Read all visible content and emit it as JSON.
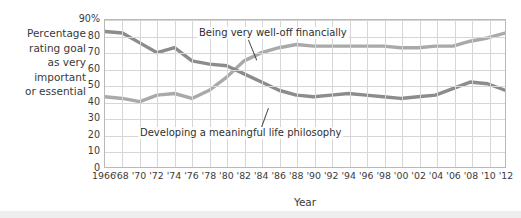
{
  "axis": {
    "y_caption_lines": [
      "Percentage",
      "rating goal",
      "as very",
      "important",
      "or essential"
    ],
    "x_caption": "Year"
  },
  "annotations": {
    "welloff": "Being very well-off financially",
    "philosophy": "Developing a meaningful life philosophy"
  },
  "colors": {
    "series_welloff": "#a9a9a9",
    "series_philosophy": "#8c8c8c",
    "grid": "#d6d6d6",
    "frame": "#b9b9b9",
    "text": "#3a3a3a"
  },
  "chart_data": {
    "type": "line",
    "title": "",
    "subtitle": "",
    "xlabel": "Year",
    "ylabel": "Percentage rating goal as very important or essential",
    "ylim": [
      0,
      90
    ],
    "yticks": [
      0,
      10,
      20,
      30,
      40,
      50,
      60,
      70,
      80,
      90
    ],
    "ytick_labels": [
      "0",
      "10",
      "20",
      "30",
      "40",
      "50",
      "60",
      "70",
      "80",
      "90%"
    ],
    "grid": true,
    "legend": "inline-annotations",
    "x": [
      1966,
      1968,
      1970,
      1972,
      1974,
      1976,
      1978,
      1980,
      1982,
      1984,
      1986,
      1988,
      1990,
      1992,
      1994,
      1996,
      1998,
      2000,
      2002,
      2004,
      2006,
      2008,
      2010,
      2012
    ],
    "xtick_labels": [
      "1966",
      "'68",
      "'70",
      "'72",
      "'74",
      "'76",
      "'78",
      "'80",
      "'82",
      "'84",
      "'86",
      "'88",
      "'90",
      "'92",
      "'94",
      "'96",
      "'98",
      "'00",
      "'02",
      "'04",
      "'06",
      "'08",
      "'10",
      "'12"
    ],
    "series": [
      {
        "name": "Being very well-off financially",
        "color": "#a9a9a9",
        "values": [
          43,
          42,
          40,
          44,
          45,
          42,
          47,
          55,
          65,
          70,
          73,
          75,
          74,
          74,
          74,
          74,
          74,
          73,
          73,
          74,
          74,
          77,
          79,
          82
        ]
      },
      {
        "name": "Developing a meaningful life philosophy",
        "color": "#8c8c8c",
        "values": [
          83,
          82,
          76,
          70,
          73,
          65,
          63,
          62,
          57,
          52,
          47,
          44,
          43,
          44,
          45,
          44,
          43,
          42,
          43,
          44,
          48,
          52,
          51,
          47
        ]
      }
    ]
  }
}
